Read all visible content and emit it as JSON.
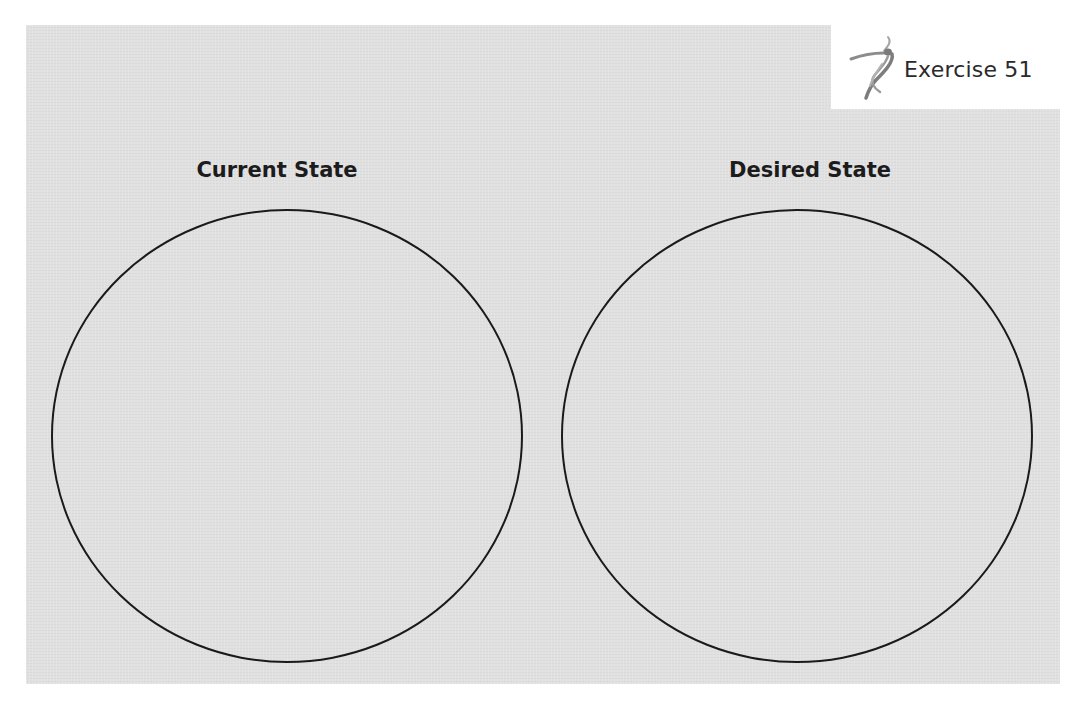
{
  "exercise": {
    "label": "Exercise 51",
    "logo_icon": "dancer-figure-icon"
  },
  "columns": [
    {
      "heading": "Current State",
      "shape": "circle"
    },
    {
      "heading": "Desired State",
      "shape": "circle"
    }
  ],
  "colors": {
    "panel_background": "#e3e3e3",
    "page_background": "#ffffff",
    "circle_stroke": "#1a1a1a",
    "heading_text": "#1c1c1c",
    "logo": "#8a8a8a"
  }
}
